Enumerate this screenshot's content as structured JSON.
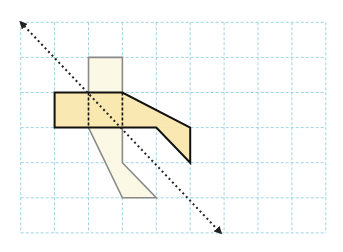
{
  "figure": {
    "grid": {
      "cols": 9,
      "rows": 6,
      "line_color": "#9ed3e3"
    },
    "original_shape": {
      "points_grid": [
        [
          1,
          2
        ],
        [
          3,
          2
        ],
        [
          5,
          3
        ],
        [
          5,
          4
        ],
        [
          4,
          3
        ],
        [
          1,
          3
        ]
      ],
      "fill": "#f8e6a8",
      "stroke": "#111111"
    },
    "image_shape": {
      "points_grid": [
        [
          2,
          1
        ],
        [
          3,
          1
        ],
        [
          3,
          4
        ],
        [
          4,
          5
        ],
        [
          3,
          5
        ],
        [
          2,
          3
        ]
      ],
      "fill": "#fbf8e6",
      "stroke": "#8a8a8a"
    },
    "mirror_line": {
      "from_grid": [
        0,
        0
      ],
      "to_grid": [
        5.9,
        6
      ],
      "style": "dotted-double-arrow"
    }
  }
}
